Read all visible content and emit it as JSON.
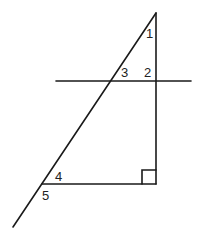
{
  "diagram": {
    "type": "geometry-angles",
    "colors": {
      "line": "#1a1a1a",
      "text": "#222222",
      "background": "#ffffff"
    },
    "points": {
      "apex": [
        156,
        13
      ],
      "right_angle_vertex": [
        156,
        184
      ],
      "bottom_left_vertex": [
        42,
        184
      ],
      "diagonal_end": [
        13,
        227
      ],
      "transversal_start": [
        56,
        81
      ],
      "transversal_end": [
        191,
        81
      ]
    },
    "angles": [
      {
        "id": "1",
        "label": "1",
        "x": 146,
        "y": 38
      },
      {
        "id": "2",
        "label": "2",
        "x": 144,
        "y": 77
      },
      {
        "id": "3",
        "label": "3",
        "x": 121,
        "y": 77
      },
      {
        "id": "4",
        "label": "4",
        "x": 55,
        "y": 181
      },
      {
        "id": "5",
        "label": "5",
        "x": 42,
        "y": 200
      }
    ],
    "right_angle_marker": {
      "x": 142,
      "y": 170,
      "size": 14
    }
  }
}
